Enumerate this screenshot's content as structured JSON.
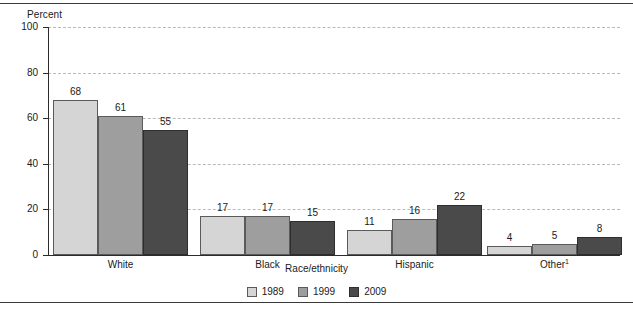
{
  "chart_data": {
    "type": "bar",
    "title": "",
    "xlabel": "Race/ethnicity",
    "ylabel": "Percent",
    "ylim": [
      0,
      100
    ],
    "yticks": [
      0,
      20,
      40,
      60,
      80,
      100
    ],
    "grid": "horizontal-dashed",
    "legend_position": "bottom-center",
    "categories": [
      "White",
      "Black",
      "Hispanic",
      "Other¹"
    ],
    "category_plain": [
      "White",
      "Black",
      "Hispanic",
      "Other"
    ],
    "category_footnote": [
      "",
      "",
      "",
      "1"
    ],
    "series": [
      {
        "name": "1989",
        "color": "#d5d5d5",
        "values": [
          68,
          17,
          11,
          4
        ]
      },
      {
        "name": "1999",
        "color": "#9e9e9e",
        "values": [
          61,
          17,
          16,
          5
        ]
      },
      {
        "name": "2009",
        "color": "#4a4a4a",
        "values": [
          55,
          15,
          22,
          8
        ]
      }
    ]
  },
  "axis": {
    "y_title": "Percent",
    "x_title": "Race/ethnicity",
    "y_tick_labels": [
      "100",
      "80",
      "60",
      "40",
      "20",
      "0"
    ]
  },
  "legend": {
    "items": [
      {
        "label": "1989"
      },
      {
        "label": "1999"
      },
      {
        "label": "2009"
      }
    ]
  },
  "colors": {
    "series_1989": "#d5d5d5",
    "series_1999": "#9e9e9e",
    "series_2009": "#4a4a4a",
    "axis": "#2b2b2b",
    "gridline": "#b9b9b9",
    "rule": "#3a3a3a"
  }
}
